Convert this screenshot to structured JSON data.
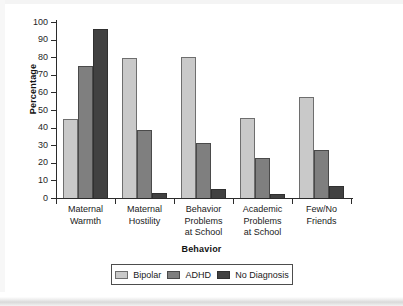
{
  "chart_data": {
    "type": "bar",
    "title": "",
    "xlabel": "Behavior",
    "ylabel": "Percentage",
    "ylim": [
      0,
      100
    ],
    "yticks": [
      0,
      10,
      20,
      30,
      40,
      50,
      60,
      70,
      80,
      90,
      100
    ],
    "grid": false,
    "legend_position": "bottom",
    "categories": [
      "Maternal Warmth",
      "Maternal Hostility",
      "Behavior Problems at School",
      "Academic Problems at School",
      "Few/No Friends"
    ],
    "category_lines": [
      [
        "Maternal",
        "Warmth"
      ],
      [
        "Maternal",
        "Hostility"
      ],
      [
        "Behavior",
        "Problems",
        "at School"
      ],
      [
        "Academic",
        "Problems",
        "at School"
      ],
      [
        "Few/No",
        "Friends"
      ]
    ],
    "series": [
      {
        "name": "Bipolar",
        "color": "#c9c9c9",
        "values": [
          45,
          79.5,
          80,
          45.5,
          57.5
        ]
      },
      {
        "name": "ADHD",
        "color": "#7f7f7f",
        "values": [
          75,
          38.5,
          31,
          22.5,
          27
        ]
      },
      {
        "name": "No Diagnosis",
        "color": "#414141",
        "values": [
          96,
          3,
          5,
          2,
          7
        ]
      }
    ]
  },
  "axis": {
    "y_title": "Percentage",
    "x_title": "Behavior",
    "y_tick_labels": [
      "100",
      "90",
      "80",
      "70",
      "60",
      "50",
      "40",
      "30",
      "20",
      "10",
      "0"
    ]
  },
  "legend": {
    "items": [
      {
        "label": "Bipolar"
      },
      {
        "label": "ADHD"
      },
      {
        "label": "No Diagnosis"
      }
    ]
  }
}
